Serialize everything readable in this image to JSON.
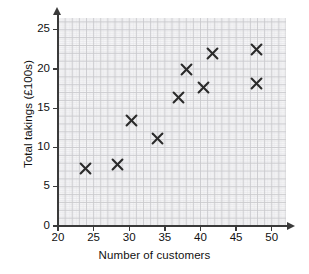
{
  "chart_data": {
    "type": "scatter",
    "title": "",
    "xlabel": "Number of customers",
    "ylabel": "Total takings (£100s)",
    "xlim": [
      20,
      52
    ],
    "ylim": [
      0,
      26.5
    ],
    "xticks": [
      20,
      25,
      30,
      35,
      40,
      45,
      50
    ],
    "yticks": [
      0,
      5,
      10,
      15,
      20,
      25
    ],
    "xtick_labels": [
      "20",
      "25",
      "30",
      "35",
      "40",
      "45",
      "50"
    ],
    "ytick_labels": [
      "0",
      "5",
      "10",
      "15",
      "20",
      "25"
    ],
    "grid": true,
    "grid_minor": true,
    "grid_color": "#c9c9cc",
    "grid_minor_color": "#e4e4e7",
    "marker": "x",
    "marker_color": "#2b2b2b",
    "legend": null,
    "points": [
      {
        "x": 23.9,
        "y": 7.3
      },
      {
        "x": 28.3,
        "y": 7.8
      },
      {
        "x": 30.3,
        "y": 13.4
      },
      {
        "x": 33.9,
        "y": 11.1
      },
      {
        "x": 36.9,
        "y": 16.4
      },
      {
        "x": 38.0,
        "y": 20.0
      },
      {
        "x": 40.4,
        "y": 17.6
      },
      {
        "x": 41.7,
        "y": 22.0
      },
      {
        "x": 47.9,
        "y": 22.5
      },
      {
        "x": 47.9,
        "y": 18.1
      }
    ]
  }
}
